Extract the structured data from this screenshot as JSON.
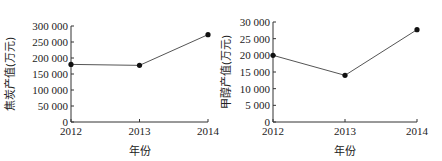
{
  "chart_data": [
    {
      "type": "line",
      "title": "",
      "xlabel": "年份",
      "ylabel": "焦炭产值(万元)",
      "categories": [
        "2012",
        "2013",
        "2014"
      ],
      "series": [
        {
          "name": "焦炭产值",
          "values": [
            180000,
            177000,
            273000
          ]
        }
      ],
      "yticks": [
        "0",
        "50 000",
        "100 000",
        "150 000",
        "200 000",
        "250 000",
        "300 000"
      ],
      "ylim": [
        0,
        300000
      ],
      "grid": false,
      "legend": null
    },
    {
      "type": "line",
      "title": "",
      "xlabel": "年份",
      "ylabel": "甲醇产值(万元)",
      "categories": [
        "2012",
        "2013",
        "2014"
      ],
      "series": [
        {
          "name": "甲醇产值",
          "values": [
            20000,
            14000,
            27700
          ]
        }
      ],
      "yticks": [
        "0",
        "5 000",
        "10 000",
        "15 000",
        "20 000",
        "25 000",
        "30 000"
      ],
      "ylim": [
        0,
        30000
      ],
      "grid": false,
      "legend": null
    }
  ]
}
